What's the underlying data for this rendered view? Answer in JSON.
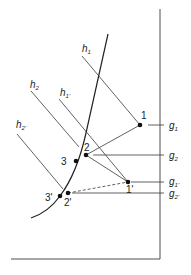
{
  "diagram": {
    "colors": {
      "line": "#3a3a3a",
      "point": "#111111",
      "background": "#ffffff"
    },
    "h_lines": [
      {
        "label": "h",
        "sub": "1"
      },
      {
        "label": "h",
        "sub": "2"
      },
      {
        "label": "h",
        "sub": "1'"
      },
      {
        "label": "h",
        "sub": "2'"
      }
    ],
    "g_lines": [
      {
        "label": "g",
        "sub": "1"
      },
      {
        "label": "g",
        "sub": "2"
      },
      {
        "label": "g",
        "sub": "1'"
      },
      {
        "label": "g",
        "sub": "2'"
      }
    ],
    "points": [
      {
        "label": "1"
      },
      {
        "label": "2"
      },
      {
        "label": "3"
      },
      {
        "label": "1'"
      },
      {
        "label": "2'"
      },
      {
        "label": "3'"
      }
    ]
  }
}
